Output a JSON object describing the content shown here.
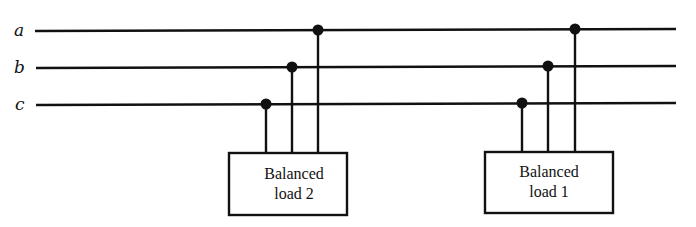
{
  "diagram": {
    "type": "three-phase bus one-line connection diagram",
    "buses": [
      {
        "label": "a",
        "y_left": 31,
        "y_right": 29
      },
      {
        "label": "b",
        "y_left": 68,
        "y_right": 66
      },
      {
        "label": "c",
        "y_left": 105,
        "y_right": 103
      }
    ],
    "loads": [
      {
        "id": "load2",
        "line1": "Balanced",
        "line2": "load 2"
      },
      {
        "id": "load1",
        "line1": "Balanced",
        "line2": "load 1"
      }
    ],
    "colors": {
      "ink": "#111111",
      "background": "#ffffff"
    }
  }
}
